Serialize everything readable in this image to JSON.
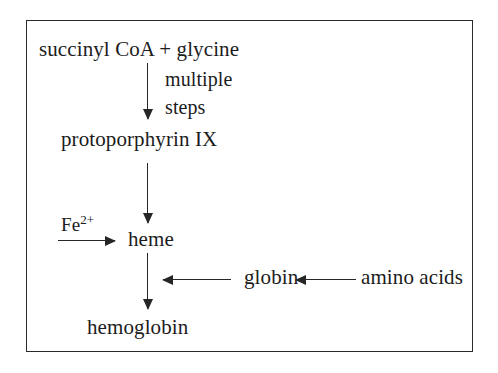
{
  "diagram": {
    "frame_color": "#2b2b2b",
    "background_color": "#ffffff",
    "text_color": "#1c1c1c",
    "nodes": {
      "precursor": "succinyl CoA + glycine",
      "intermediate": "protoporphyrin IX",
      "heme": "heme",
      "globin": "globin",
      "amino_acids": "amino acids",
      "product": "hemoglobin"
    },
    "labels": {
      "multiple": "multiple",
      "steps": "steps",
      "iron_symbol": "Fe",
      "iron_charge": "2+"
    },
    "arrows": [
      {
        "name": "succinyl-to-protoporphyrin",
        "direction": "down",
        "label": "multiple steps"
      },
      {
        "name": "protoporphyrin-to-heme",
        "direction": "down",
        "label": ""
      },
      {
        "name": "iron-to-heme",
        "direction": "right",
        "label": "Fe2+"
      },
      {
        "name": "heme-to-hemoglobin",
        "direction": "down",
        "label": ""
      },
      {
        "name": "globin-to-hemoglobin",
        "direction": "left",
        "label": ""
      },
      {
        "name": "amino-acids-to-globin",
        "direction": "left",
        "label": ""
      }
    ]
  }
}
